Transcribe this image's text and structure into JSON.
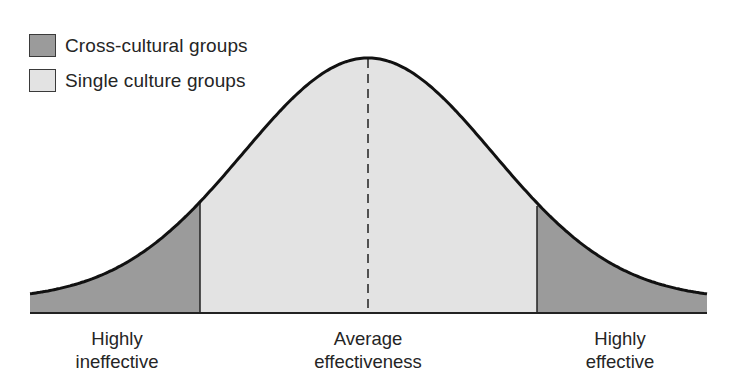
{
  "chart_data": {
    "type": "area",
    "title": "",
    "legend": [
      {
        "label": "Cross-cultural groups",
        "color": "#9b9b9b"
      },
      {
        "label": "Single culture groups",
        "color": "#e3e3e3"
      }
    ],
    "x_axis_labels": [
      {
        "line1": "Highly",
        "line2": "ineffective",
        "position": "left"
      },
      {
        "line1": "Average",
        "line2": "effectiveness",
        "position": "center"
      },
      {
        "line1": "Highly",
        "line2": "effective",
        "position": "right"
      }
    ],
    "regions": [
      {
        "series": "Cross-cultural groups",
        "range": "left tail",
        "x_from_px": 30,
        "x_to_px": 200
      },
      {
        "series": "Single culture groups",
        "range": "center",
        "x_from_px": 200,
        "x_to_px": 537
      },
      {
        "series": "Cross-cultural groups",
        "range": "right tail",
        "x_from_px": 537,
        "x_to_px": 707
      }
    ],
    "mean_marker": {
      "style": "dashed",
      "label": "Average effectiveness"
    },
    "grid": false,
    "legend_position": "top-left"
  },
  "legend": {
    "items": [
      {
        "label": "Cross-cultural groups",
        "color": "#9b9b9b"
      },
      {
        "label": "Single culture groups",
        "color": "#e3e3e3"
      }
    ]
  },
  "labels": {
    "left": {
      "line1": "Highly",
      "line2": "ineffective"
    },
    "center": {
      "line1": "Average",
      "line2": "effectiveness"
    },
    "right": {
      "line1": "Highly",
      "line2": "effective"
    }
  },
  "colors": {
    "tail": "#9b9b9b",
    "center": "#e3e3e3",
    "stroke": "#111111"
  }
}
